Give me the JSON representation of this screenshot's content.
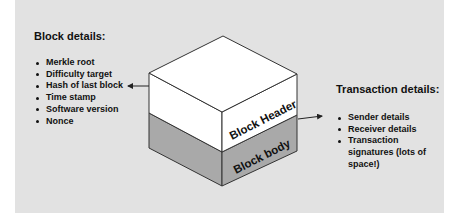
{
  "block_details": {
    "heading": "Block details:",
    "items": [
      "Merkle root",
      "Difficulty target",
      "Hash of last block",
      "Time stamp",
      "Software version",
      "Nonce"
    ]
  },
  "block": {
    "header_label": "Block Header",
    "body_label": "Block body",
    "colors": {
      "header": "#ffffff",
      "body": "#a9a9a9",
      "outline": "#333333",
      "background": "#e2e2e2"
    }
  },
  "transaction_details": {
    "heading": "Transaction details:",
    "items": [
      "Sender details",
      "Receiver details",
      "Transaction signatures (lots of space!)"
    ]
  },
  "connectors": [
    {
      "from": "block-header",
      "to": "hash-of-last-block",
      "style": "arrow"
    },
    {
      "from": "block-body",
      "to": "transaction-details",
      "style": "arrow"
    }
  ]
}
